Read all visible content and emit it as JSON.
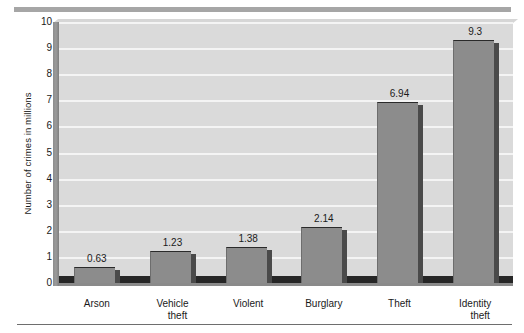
{
  "chart_data": {
    "type": "bar",
    "title": "",
    "subtitle": "",
    "xlabel": "",
    "ylabel": "Number of crimes in millions",
    "categories": [
      "Arson",
      "Vehicle theft",
      "Violent",
      "Burglary",
      "Theft",
      "Identity theft"
    ],
    "category_lines": [
      [
        "Arson"
      ],
      [
        "Vehicle",
        "theft"
      ],
      [
        "Violent"
      ],
      [
        "Burglary"
      ],
      [
        "Theft"
      ],
      [
        "Identity",
        "theft"
      ]
    ],
    "values": [
      0.63,
      1.23,
      1.38,
      2.14,
      6.94,
      9.3
    ],
    "value_labels": [
      "0.63",
      "1.23",
      "1.38",
      "2.14",
      "6.94",
      "9.3"
    ],
    "ylim": [
      0,
      10
    ],
    "y_ticks": [
      0,
      1,
      2,
      3,
      4,
      5,
      6,
      7,
      8,
      9,
      10
    ],
    "y_tick_labels": [
      "0",
      "1",
      "2",
      "3",
      "4",
      "5",
      "6",
      "7",
      "8",
      "9",
      "10"
    ],
    "grid": true,
    "grid_axis": "y",
    "legend": false,
    "legend_position": "none",
    "bar_color": "#8c8c8c",
    "bar_edge_color": "#2a2a2a",
    "plot_background": "#dadada",
    "gridline_color": "#f4f4f4",
    "style": "3d-perspective-bar"
  },
  "decorations": {
    "top_rule_color": "#a6a6a6",
    "bottom_rule_color": "#6e6e6e"
  }
}
